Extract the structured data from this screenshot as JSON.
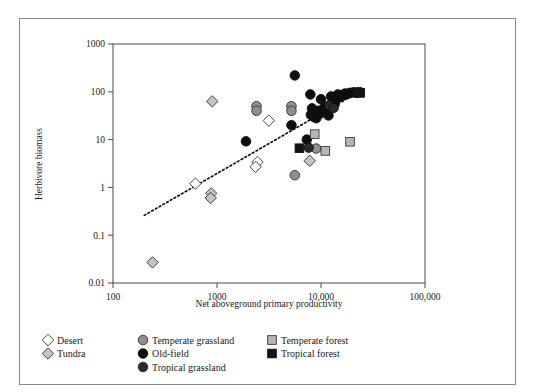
{
  "chart_data": {
    "type": "scatter",
    "title": "",
    "xlabel": "Net aboveground primary productivity",
    "ylabel": "Herbivore biomass",
    "xscale": "log",
    "yscale": "log",
    "xlim": [
      100,
      100000
    ],
    "ylim": [
      0.01,
      1000
    ],
    "xticks": [
      100,
      1000,
      10000,
      100000
    ],
    "xticklabels": [
      "100",
      "1000",
      "10,000",
      "100,000"
    ],
    "yticks": [
      1000,
      100,
      10,
      1,
      0.1,
      0.01
    ],
    "yticklabels": [
      "1000",
      "100",
      "10",
      "1",
      "0.1",
      "0.01"
    ],
    "grid": false,
    "legend_position": "below-axes",
    "trendline": {
      "style": "dotted",
      "x": [
        200,
        25000
      ],
      "y": [
        0.26,
        110
      ]
    },
    "series": [
      {
        "name": "Desert",
        "marker": "diamond",
        "fill": "#ffffff",
        "edge": "#333333",
        "points": [
          {
            "x": 620,
            "y": 1.2
          },
          {
            "x": 3150,
            "y": 25.0
          },
          {
            "x": 2450,
            "y": 3.4
          },
          {
            "x": 2350,
            "y": 2.7
          }
        ]
      },
      {
        "name": "Tundra",
        "marker": "diamond",
        "fill": "#c3c3c3",
        "edge": "#333333",
        "points": [
          {
            "x": 240,
            "y": 0.027
          },
          {
            "x": 880,
            "y": 0.75
          },
          {
            "x": 870,
            "y": 0.6
          },
          {
            "x": 900,
            "y": 63.0
          },
          {
            "x": 7800,
            "y": 3.6
          }
        ]
      },
      {
        "name": "Temperate grassland",
        "marker": "circle",
        "fill": "#8f8f8f",
        "edge": "#333333",
        "points": [
          {
            "x": 2400,
            "y": 50.0
          },
          {
            "x": 2400,
            "y": 40.0
          },
          {
            "x": 5200,
            "y": 50.0
          },
          {
            "x": 5200,
            "y": 40.0
          },
          {
            "x": 5600,
            "y": 1.8
          },
          {
            "x": 9000,
            "y": 6.5
          }
        ]
      },
      {
        "name": "Old-field",
        "marker": "circle",
        "fill": "#0e0e0e",
        "edge": "#0e0e0e",
        "points": [
          {
            "x": 1900,
            "y": 9.2
          },
          {
            "x": 5600,
            "y": 220.0
          },
          {
            "x": 5200,
            "y": 20.0
          },
          {
            "x": 7300,
            "y": 10.0
          },
          {
            "x": 7900,
            "y": 88.0
          },
          {
            "x": 8200,
            "y": 45.0
          },
          {
            "x": 8000,
            "y": 33.0
          },
          {
            "x": 8500,
            "y": 30.0
          },
          {
            "x": 9000,
            "y": 28.0
          },
          {
            "x": 9400,
            "y": 40.0
          },
          {
            "x": 9800,
            "y": 35.0
          },
          {
            "x": 10000,
            "y": 70.0
          },
          {
            "x": 10500,
            "y": 44.0
          },
          {
            "x": 11000,
            "y": 48.0
          },
          {
            "x": 11500,
            "y": 40.0
          },
          {
            "x": 11800,
            "y": 32.0
          },
          {
            "x": 12500,
            "y": 80.0
          },
          {
            "x": 13000,
            "y": 60.0
          },
          {
            "x": 13500,
            "y": 55.0
          },
          {
            "x": 14000,
            "y": 75.0
          },
          {
            "x": 14500,
            "y": 88.0
          },
          {
            "x": 15500,
            "y": 78.0
          },
          {
            "x": 16000,
            "y": 85.0
          },
          {
            "x": 17000,
            "y": 92.0
          },
          {
            "x": 18000,
            "y": 90.0
          },
          {
            "x": 19000,
            "y": 95.0
          },
          {
            "x": 20500,
            "y": 97.0
          },
          {
            "x": 22000,
            "y": 95.0
          },
          {
            "x": 23500,
            "y": 98.0
          }
        ]
      },
      {
        "name": "Tropical grassland",
        "marker": "circle",
        "fill": "#2a2a2a",
        "edge": "#111111",
        "points": [
          {
            "x": 7600,
            "y": 6.8
          },
          {
            "x": 12000,
            "y": 52.0
          },
          {
            "x": 13200,
            "y": 46.0
          }
        ]
      },
      {
        "name": "Temperate forest",
        "marker": "square",
        "fill": "#b6b6b6",
        "edge": "#3a3a3a",
        "points": [
          {
            "x": 8700,
            "y": 13.0
          },
          {
            "x": 11000,
            "y": 5.8
          },
          {
            "x": 19000,
            "y": 9.0
          }
        ]
      },
      {
        "name": "Tropical forest",
        "marker": "square",
        "fill": "#141414",
        "edge": "#141414",
        "points": [
          {
            "x": 6200,
            "y": 6.6
          },
          {
            "x": 22500,
            "y": 98.0
          },
          {
            "x": 23800,
            "y": 95.0
          }
        ]
      }
    ]
  },
  "legend": {
    "columns": [
      {
        "items": [
          {
            "label": "Desert",
            "marker": "diamond",
            "fill": "#ffffff"
          },
          {
            "label": "Tundra",
            "marker": "diamond",
            "fill": "#c3c3c3"
          }
        ]
      },
      {
        "items": [
          {
            "label": "Temperate grassland",
            "marker": "circle",
            "fill": "#8f8f8f"
          },
          {
            "label": "Old-field",
            "marker": "circle",
            "fill": "#0e0e0e"
          },
          {
            "label": "Tropical grassland",
            "marker": "circle",
            "fill": "#2a2a2a"
          }
        ]
      },
      {
        "items": [
          {
            "label": "Temperate forest",
            "marker": "square",
            "fill": "#b6b6b6"
          },
          {
            "label": "Tropical forest",
            "marker": "square",
            "fill": "#141414"
          }
        ]
      }
    ]
  },
  "geometry": {
    "plot_left": 113,
    "plot_right": 425,
    "plot_top": 44,
    "plot_bottom": 283
  }
}
